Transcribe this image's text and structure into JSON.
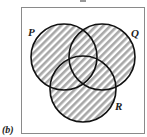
{
  "figure": {
    "panel_label": "(b)",
    "sets": [
      {
        "name": "P",
        "cx": 64,
        "cy": 57,
        "r": 33
      },
      {
        "name": "Q",
        "cx": 102,
        "cy": 57,
        "r": 33
      },
      {
        "name": "R",
        "cx": 83,
        "cy": 89,
        "r": 33
      }
    ],
    "shaded_region": "P ∪ Q ∪ R",
    "colors": {
      "outline": "#111111",
      "hatch_light": "#ffffff",
      "hatch_dark": "#a8a8a8",
      "frame": "#8a8a8a"
    }
  }
}
